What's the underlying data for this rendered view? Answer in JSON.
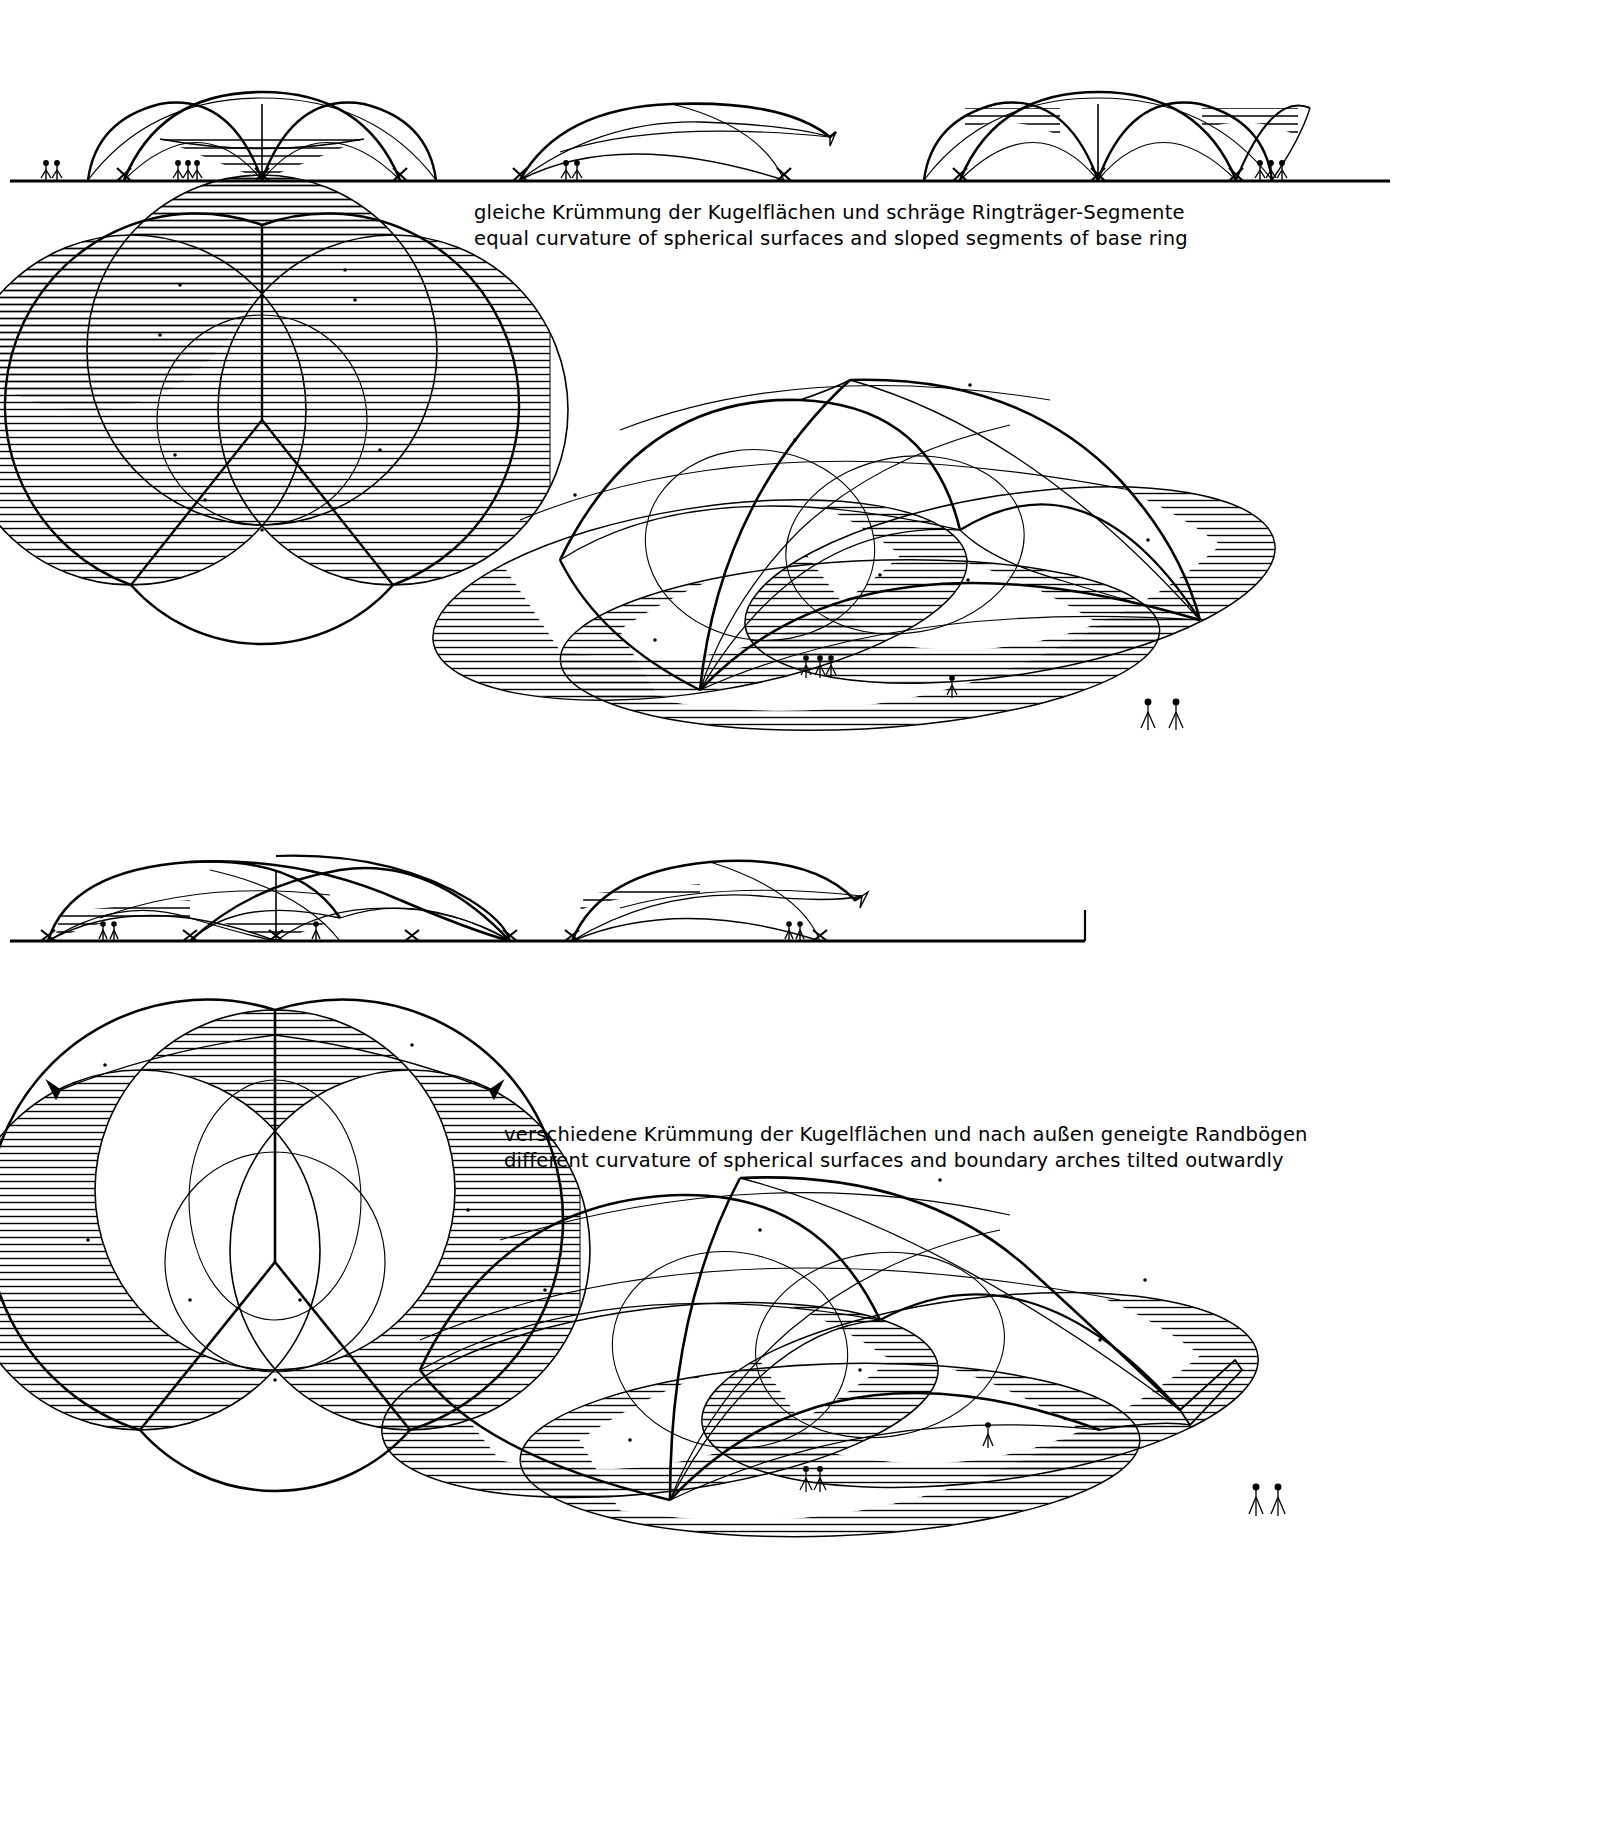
{
  "sheet": {
    "title": "Spherical shell dome studies — plan, elevation and axonometric",
    "ink_color": "#000000",
    "paper_color": "#ffffff"
  },
  "blocks": [
    {
      "id": "block-upper",
      "caption": {
        "german": "gleiche Krümmung der Kugelflächen und schräge Ringträger-Segmente",
        "english": "equal curvature of spherical surfaces and sloped segments of base ring"
      },
      "elevations": [
        {
          "id": "elevation-upper-front",
          "label": "front elevation",
          "people": 5,
          "hatched_panels": 1
        },
        {
          "id": "elevation-upper-side",
          "label": "side elevation",
          "people": 2,
          "hatched_panels": 0
        },
        {
          "id": "elevation-upper-rear",
          "label": "rear elevation",
          "people": 3,
          "hatched_panels": 2
        }
      ],
      "plan": {
        "id": "plan-upper",
        "label": "plan view",
        "circles": 3,
        "hatched_crescents": 3
      },
      "axono": {
        "id": "axono-upper",
        "label": "axonometric view",
        "shells": 3,
        "people": 6
      }
    },
    {
      "id": "block-lower",
      "caption": {
        "german": "verschiedene Krümmung der Kugelflächen und nach außen geneigte Randbögen",
        "english": "different curvature of spherical surfaces and boundary arches tilted outwardly"
      },
      "elevations": [
        {
          "id": "elevation-lower-front",
          "label": "front elevation",
          "people": 3,
          "hatched_panels": 2
        },
        {
          "id": "elevation-lower-side",
          "label": "side elevation",
          "people": 2,
          "hatched_panels": 1
        }
      ],
      "plan": {
        "id": "plan-lower",
        "label": "plan view",
        "circles": 3,
        "hatched_crescents": 3
      },
      "axono": {
        "id": "axono-lower",
        "label": "axonometric view",
        "shells": 3,
        "people": 4
      }
    }
  ]
}
